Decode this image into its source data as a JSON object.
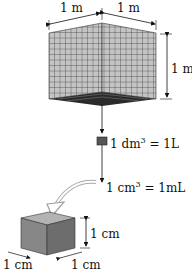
{
  "big_cube": {
    "width_label": "1 m",
    "depth_label": "1 m",
    "height_label": "1 m"
  },
  "medium_cube": {
    "label_left": "1 dm",
    "label_exp": "3",
    "label_right": " = 1L"
  },
  "small_cube_marker": {
    "label_left": "1 cm",
    "label_exp": "3",
    "label_right": " = 1mL"
  },
  "small_cube": {
    "height_label": "1 cm",
    "width_label": "1 cm",
    "depth_label": "1 cm"
  },
  "colors": {
    "grid_face": "#c8c8c8",
    "grid_lines": "#333333",
    "small_cube_front": "#8a8a8a",
    "small_cube_side": "#6e6e6e",
    "small_cube_top": "#b0b0b0",
    "curved_arrow": "#a8a8a8"
  }
}
